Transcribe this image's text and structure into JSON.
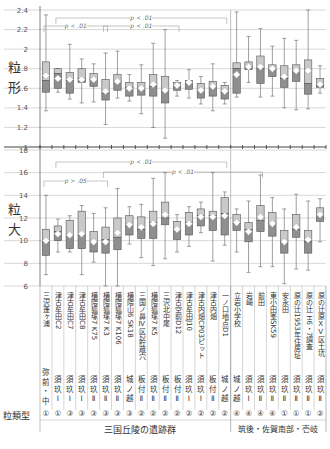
{
  "chart_data": [
    {
      "type": "box",
      "panel": "top",
      "ylabel": "粒形",
      "ylim": [
        1.0,
        2.4
      ],
      "yticks": [
        1,
        1.2,
        1.4,
        1.6,
        1.8,
        2,
        2.2,
        2.4
      ],
      "grid": true,
      "annotations": [
        {
          "text": "p < .01",
          "from_col": 1,
          "to_col": 15
        },
        {
          "text": "p < .01",
          "from_col": 0,
          "to_col": 5
        },
        {
          "text": "p < .01",
          "from_col": 5,
          "to_col": 11
        }
      ],
      "boxes": [
        {
          "min": 1.37,
          "q1": 1.56,
          "median": 1.68,
          "q3": 1.87,
          "max": 2.35,
          "mean": 1.73
        },
        {
          "min": 1.56,
          "q1": 1.6,
          "median": 1.75,
          "q3": 1.8,
          "max": 1.8,
          "mean": 1.7
        },
        {
          "min": 1.49,
          "q1": 1.55,
          "median": 1.68,
          "q3": 1.76,
          "max": 2.05,
          "mean": 1.69
        },
        {
          "min": 1.45,
          "q1": 1.66,
          "median": 1.7,
          "q3": 1.8,
          "max": 1.9,
          "mean": 1.69
        },
        {
          "min": 1.46,
          "q1": 1.62,
          "median": 1.69,
          "q3": 1.75,
          "max": 1.85,
          "mean": 1.69
        },
        {
          "min": 1.23,
          "q1": 1.48,
          "median": 1.55,
          "q3": 1.69,
          "max": 1.96,
          "mean": 1.57
        },
        {
          "min": 1.5,
          "q1": 1.58,
          "median": 1.67,
          "q3": 1.74,
          "max": 1.98,
          "mean": 1.67
        },
        {
          "min": 1.47,
          "q1": 1.52,
          "median": 1.61,
          "q3": 1.66,
          "max": 1.74,
          "mean": 1.6
        },
        {
          "min": 1.34,
          "q1": 1.53,
          "median": 1.6,
          "q3": 1.66,
          "max": 1.84,
          "mean": 1.6
        },
        {
          "min": 1.2,
          "q1": 1.52,
          "median": 1.62,
          "q3": 1.74,
          "max": 2.06,
          "mean": 1.64
        },
        {
          "min": 1.09,
          "q1": 1.45,
          "median": 1.58,
          "q3": 1.72,
          "max": 2.2,
          "mean": 1.58
        },
        {
          "min": 1.52,
          "q1": 1.58,
          "median": 1.63,
          "q3": 1.66,
          "max": 1.68,
          "mean": 1.63
        },
        {
          "min": 1.5,
          "q1": 1.59,
          "median": 1.65,
          "q3": 1.68,
          "max": 1.79,
          "mean": 1.66
        },
        {
          "min": 1.44,
          "q1": 1.5,
          "median": 1.58,
          "q3": 1.65,
          "max": 1.72,
          "mean": 1.58
        },
        {
          "min": 1.37,
          "q1": 1.52,
          "median": 1.62,
          "q3": 1.67,
          "max": 1.85,
          "mean": 1.62
        },
        {
          "min": 1.44,
          "q1": 1.49,
          "median": 1.56,
          "q3": 1.63,
          "max": 1.66,
          "mean": 1.57
        },
        {
          "min": 1.51,
          "q1": 1.55,
          "median": 1.8,
          "q3": 1.86,
          "max": 2.38,
          "mean": 1.74
        },
        {
          "min": 1.66,
          "q1": 1.79,
          "median": 1.82,
          "q3": 1.87,
          "max": 2.13,
          "mean": 1.82
        },
        {
          "min": 1.51,
          "q1": 1.65,
          "median": 1.8,
          "q3": 1.93,
          "max": 2.21,
          "mean": 1.82
        },
        {
          "min": 1.52,
          "q1": 1.72,
          "median": 1.79,
          "q3": 1.84,
          "max": 2.03,
          "mean": 1.8
        },
        {
          "min": 1.4,
          "q1": 1.61,
          "median": 1.7,
          "q3": 1.83,
          "max": 2.11,
          "mean": 1.72
        },
        {
          "min": 1.38,
          "q1": 1.67,
          "median": 1.78,
          "q3": 1.84,
          "max": 2.09,
          "mean": 1.78
        },
        {
          "min": 1.39,
          "q1": 1.54,
          "median": 1.65,
          "q3": 1.89,
          "max": 2.4,
          "mean": 1.78
        },
        {
          "min": 1.55,
          "q1": 1.61,
          "median": 1.63,
          "q3": 1.7,
          "max": 1.83,
          "mean": 1.64
        }
      ]
    },
    {
      "type": "box",
      "panel": "bottom",
      "ylabel": "粒大",
      "ylim": [
        6,
        18
      ],
      "yticks": [
        6,
        8,
        10,
        12,
        14,
        16,
        18
      ],
      "grid": true,
      "annotations": [
        {
          "text": "p < .01",
          "from_col": 1,
          "to_col": 15
        },
        {
          "text": "p < .01",
          "from_col": 5,
          "to_col": 18
        },
        {
          "text": "p > .05",
          "from_col": 0,
          "to_col": 5
        }
      ],
      "boxes": [
        {
          "min": 7.0,
          "q1": 8.7,
          "median": 9.9,
          "q3": 11.0,
          "max": 14.0,
          "mean": 10.0
        },
        {
          "min": 9.0,
          "q1": 10.0,
          "median": 10.8,
          "q3": 11.3,
          "max": 11.9,
          "mean": 10.6
        },
        {
          "min": 9.0,
          "q1": 9.3,
          "median": 10.5,
          "q3": 11.8,
          "max": 12.2,
          "mean": 10.5
        },
        {
          "min": 7.0,
          "q1": 9.3,
          "median": 10.5,
          "q3": 12.6,
          "max": 13.1,
          "mean": 10.6
        },
        {
          "min": 8.1,
          "q1": 9.0,
          "median": 9.9,
          "q3": 10.8,
          "max": 12.4,
          "mean": 9.9
        },
        {
          "min": 6.0,
          "q1": 8.9,
          "median": 10.1,
          "q3": 11.2,
          "max": 12.9,
          "mean": 9.9
        },
        {
          "min": 6.0,
          "q1": 9.2,
          "median": 10.3,
          "q3": 12.0,
          "max": 14.6,
          "mean": 10.7
        },
        {
          "min": 9.7,
          "q1": 10.5,
          "median": 11.3,
          "q3": 12.2,
          "max": 13.0,
          "mean": 11.4
        },
        {
          "min": 8.5,
          "q1": 10.2,
          "median": 11.0,
          "q3": 12.1,
          "max": 13.2,
          "mean": 11.2
        },
        {
          "min": 7.8,
          "q1": 10.2,
          "median": 11.6,
          "q3": 12.6,
          "max": 15.5,
          "mean": 11.5
        },
        {
          "min": 8.4,
          "q1": 11.4,
          "median": 12.0,
          "q3": 13.4,
          "max": 16.0,
          "mean": 12.3
        },
        {
          "min": 9.0,
          "q1": 10.1,
          "median": 11.0,
          "q3": 11.7,
          "max": 12.3,
          "mean": 11.0
        },
        {
          "min": 9.5,
          "q1": 10.5,
          "median": 11.6,
          "q3": 12.5,
          "max": 13.0,
          "mean": 11.5
        },
        {
          "min": 10.7,
          "q1": 11.3,
          "median": 12.2,
          "q3": 12.8,
          "max": 13.4,
          "mean": 12.1
        },
        {
          "min": 8.2,
          "q1": 10.9,
          "median": 12.2,
          "q3": 12.6,
          "max": 16.0,
          "mean": 12.1
        },
        {
          "min": 9.6,
          "q1": 10.5,
          "median": 12.4,
          "q3": 13.8,
          "max": 14.3,
          "mean": 12.2
        },
        {
          "min": 9.0,
          "q1": 10.9,
          "median": 11.5,
          "q3": 12.3,
          "max": 12.8,
          "mean": 11.6
        },
        {
          "min": 7.2,
          "q1": 9.9,
          "median": 11.0,
          "q3": 11.6,
          "max": 13.5,
          "mean": 10.8
        },
        {
          "min": 7.7,
          "q1": 10.8,
          "median": 11.8,
          "q3": 13.1,
          "max": 15.8,
          "mean": 12.1
        },
        {
          "min": 7.7,
          "q1": 10.4,
          "median": 11.5,
          "q3": 12.5,
          "max": 13.8,
          "mean": 11.5
        },
        {
          "min": 6.2,
          "q1": 8.9,
          "median": 9.9,
          "q3": 10.9,
          "max": 12.8,
          "mean": 9.9
        },
        {
          "min": 7.5,
          "q1": 10.3,
          "median": 11.0,
          "q3": 12.3,
          "max": 14.1,
          "mean": 11.2
        },
        {
          "min": 7.4,
          "q1": 8.9,
          "median": 9.9,
          "q3": 10.9,
          "max": 13.5,
          "mean": 10.1
        },
        {
          "min": 9.9,
          "q1": 11.7,
          "median": 12.3,
          "q3": 12.9,
          "max": 13.7,
          "mean": 12.3
        }
      ]
    }
  ],
  "columns": [
    {
      "site": "三沢蓬ヶ浦",
      "period": "弥前・中",
      "type": "①"
    },
    {
      "site": "津古牟田C2",
      "period": "須玖Ⅰ",
      "type": "①"
    },
    {
      "site": "津古牟田C7",
      "period": "須玖Ⅰ",
      "type": "③"
    },
    {
      "site": "津古牟田C8",
      "period": "須玖Ⅰ",
      "type": "③"
    },
    {
      "site": "横隈狐塚7 K75",
      "period": "須玖Ⅱ",
      "type": "③"
    },
    {
      "site": "横隈狐塚7 K3",
      "period": "須玖Ⅱ",
      "type": "③"
    },
    {
      "site": "横隈狐塚7 K106",
      "period": "須玖Ⅱ",
      "type": "③"
    },
    {
      "site": "横隈山6 SK18",
      "period": "城ノ越",
      "type": "③"
    },
    {
      "site": "三国ノ鼻Ⅳ区2貯蔵穴",
      "period": "板付Ⅱ",
      "type": "②"
    },
    {
      "site": "横隈狐塚7 K5",
      "period": "須玖Ⅱ",
      "type": "②"
    },
    {
      "site": "三沢北中尾",
      "period": "板付Ⅱ",
      "type": "②"
    },
    {
      "site": "津古空前D12",
      "period": "板付Ⅱ",
      "type": "②"
    },
    {
      "site": "津古牟田J10",
      "period": "須玖Ⅰ",
      "type": "②"
    },
    {
      "site": "津古内畑CP03ピット",
      "period": "須玖Ⅰ",
      "type": "②"
    },
    {
      "site": "津古内畑",
      "period": "板付Ⅱ",
      "type": "②"
    },
    {
      "site": "一ノ口地点D1",
      "period": "城ノ越",
      "type": "②"
    },
    {
      "site": "立岩小学校",
      "period": "城ノ越",
      "type": "④"
    },
    {
      "site": "岩崎",
      "period": "須玖Ⅰ",
      "type": "④"
    },
    {
      "site": "前田",
      "period": "須玖Ⅱ",
      "type": "④"
    },
    {
      "site": "東小田峯SK59",
      "period": "須玖Ⅱ",
      "type": "④"
    },
    {
      "site": "安永田",
      "period": "須玖Ⅱ",
      "type": "①"
    },
    {
      "site": "原の辻1953年住居址",
      "period": "須玖Ⅱ",
      "type": "①"
    },
    {
      "site": "原の辻 H6・7調査",
      "period": "須玖Ⅱ",
      "type": "①"
    },
    {
      "site": "原の辻原ⅩⅤ区土坑",
      "period": "須玖Ⅱ",
      "type": "②"
    }
  ],
  "labels": {
    "top_ylabel_1": "粒",
    "top_ylabel_2": "形",
    "bottom_ylabel_1": "粒",
    "bottom_ylabel_2": "大",
    "row_type_label": "粒類型",
    "group1": "三国丘陵の遺跡群",
    "group2": "筑後・佐賀南部・壱岐"
  },
  "colors": {
    "box_upper": "#c9c9c9",
    "box_lower": "#8f8f8f",
    "box_edge": "#555555",
    "grid": "#bdbdbd",
    "whisker": "#777777",
    "mean_marker": "#ffffff"
  }
}
